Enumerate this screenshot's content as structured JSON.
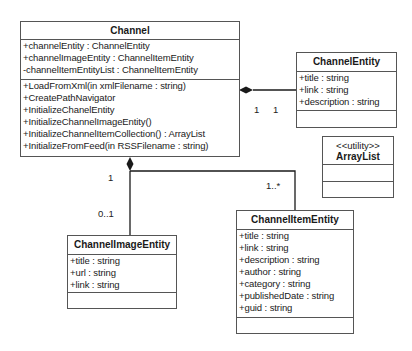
{
  "classes": {
    "channel": {
      "name": "Channel",
      "attributes": [
        "+channelEntity : ChannelEntity",
        "+channelImageEntity : ChannelItemEntity",
        "-channelItemEntityList : ChannelItemEntity"
      ],
      "methods": [
        "+LoadFromXml(in xmlFilename :  string)",
        "+CreatePathNavigator",
        "+InitializeChanelEntity",
        "+InitializeChannelImageEntity()",
        "+InitializeChannelItemCollection() : ArrayList",
        "+InitializeFromFeed(in RSSFilename : string)"
      ]
    },
    "channel_entity": {
      "name": "ChannelEntity",
      "attributes": [
        "+title : string",
        "+link : string",
        "+description : string"
      ]
    },
    "array_list": {
      "stereotype": "<<utility>>",
      "name": "ArrayList"
    },
    "channel_image_entity": {
      "name": "ChannelImageEntity",
      "attributes": [
        "+title : string",
        "+url : string",
        "+link : string"
      ]
    },
    "channel_item_entity": {
      "name": "ChannelItemEntity",
      "attributes": [
        "+title : string",
        "+link : string",
        "+description : string",
        "+author : string",
        "+category : string",
        "+publishedDate : string",
        "+guid : string"
      ]
    }
  },
  "relationships": {
    "channel_to_channel_entity": {
      "type": "composition",
      "source_mult": "1",
      "target_mult": "1"
    },
    "channel_to_channel_image_entity": {
      "type": "composition",
      "source_mult": "1",
      "target_mult": "0..1"
    },
    "channel_to_channel_item_entity": {
      "type": "composition",
      "target_mult": "1..*"
    }
  },
  "colors": {
    "line": "#1a1a1a",
    "border": "#555555",
    "background": "#ffffff"
  }
}
